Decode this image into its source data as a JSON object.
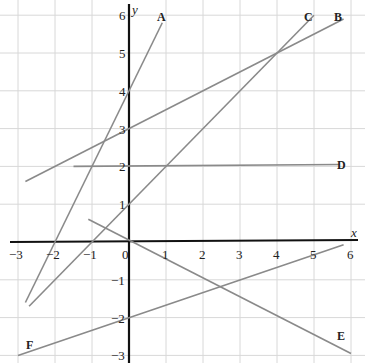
{
  "chart_data": {
    "type": "line",
    "title": "",
    "xlabel": "x",
    "ylabel": "y",
    "xlim": [
      -3,
      6
    ],
    "ylim": [
      -3,
      6
    ],
    "grid": true,
    "x_ticks": [
      "−3",
      "−2",
      "−1",
      "0",
      "1",
      "2",
      "3",
      "4",
      "5",
      "6"
    ],
    "y_ticks": [
      "6",
      "5",
      "4",
      "3",
      "2",
      "1",
      "−1",
      "−2",
      "−3"
    ],
    "series": [
      {
        "name": "A",
        "equation": "y = 2x + 4",
        "points": [
          [
            -2.8,
            -1.6
          ],
          [
            0.9,
            5.8
          ]
        ]
      },
      {
        "name": "B",
        "equation": "y = 0.5x + 3",
        "points": [
          [
            -2.8,
            1.6
          ],
          [
            5.8,
            5.9
          ]
        ]
      },
      {
        "name": "C",
        "equation": "y = x + 1",
        "points": [
          [
            -2.7,
            -1.7
          ],
          [
            5.0,
            6.0
          ]
        ]
      },
      {
        "name": "D",
        "equation": "y = 2",
        "points": [
          [
            -1.5,
            2.0
          ],
          [
            5.7,
            2.05
          ]
        ]
      },
      {
        "name": "E",
        "equation": "y = -0.5x",
        "points": [
          [
            -1.1,
            0.6
          ],
          [
            6.0,
            -2.95
          ]
        ]
      },
      {
        "name": "F",
        "equation": "y = x/3 - 2",
        "points": [
          [
            -3.0,
            -3.0
          ],
          [
            5.8,
            -0.07
          ]
        ]
      }
    ]
  },
  "labels": {
    "x_axis": "x",
    "y_axis": "y",
    "A": "A",
    "B": "B",
    "C": "C",
    "D": "D",
    "E": "E",
    "F": "F"
  }
}
